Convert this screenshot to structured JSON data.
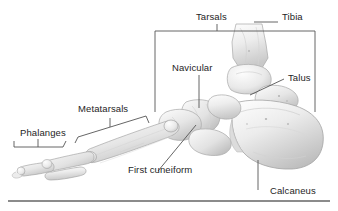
{
  "figure": {
    "background_color": "#ffffff",
    "text_color": "#1e1e1e",
    "line_color": "#555555",
    "rule_color": "#8b8b8b"
  },
  "labels": {
    "tarsals": "Tarsals",
    "tibia": "Tibia",
    "navicular": "Navicular",
    "talus": "Talus",
    "metatarsals": "Metatarsals",
    "phalanges": "Phalanges",
    "first_cuneiform": "First cuneiform",
    "calcaneus": "Calcaneus"
  },
  "bone_regions": [
    {
      "name": "Tibia",
      "label": "Tibia",
      "leader": "horizontal-left"
    },
    {
      "name": "Talus",
      "label": "Talus",
      "leader": "diagonal-down-left"
    },
    {
      "name": "Navicular",
      "label": "Navicular",
      "leader": "vertical-down"
    },
    {
      "name": "Calcaneus",
      "label": "Calcaneus",
      "leader": "vertical-up"
    },
    {
      "name": "First cuneiform",
      "label": "First cuneiform",
      "leader": "diagonal-up-right"
    },
    {
      "name": "Tarsals",
      "label": "Tarsals",
      "bracket": "rectangular-span"
    },
    {
      "name": "Metatarsals",
      "label": "Metatarsals",
      "bracket": "slanted-span"
    },
    {
      "name": "Phalanges",
      "label": "Phalanges",
      "bracket": "flat-span"
    }
  ]
}
